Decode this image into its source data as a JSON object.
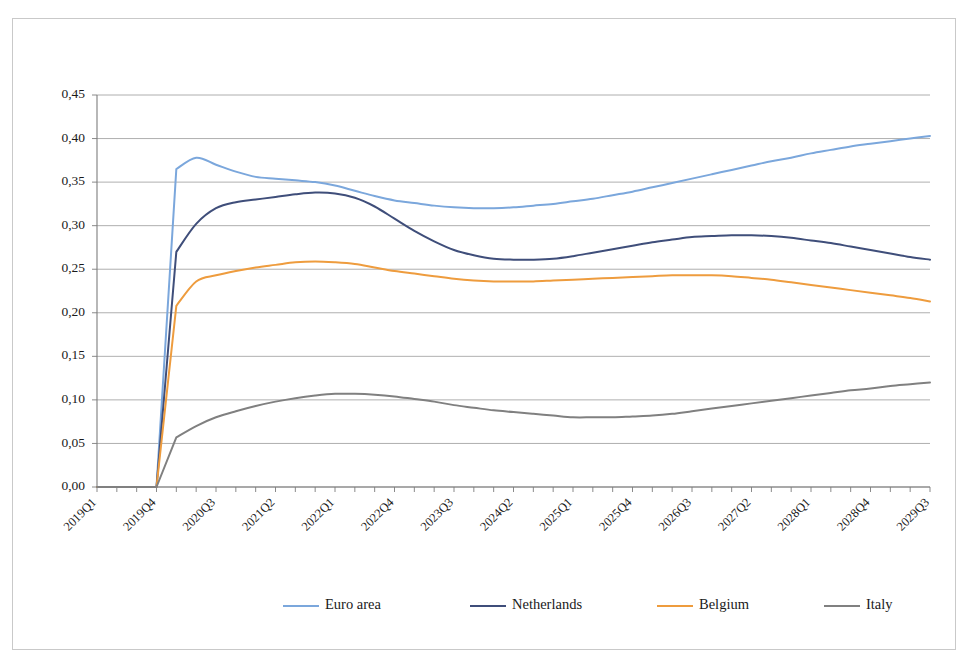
{
  "chart_data": {
    "type": "line",
    "title": "",
    "xlabel": "",
    "ylabel": "",
    "ylim": [
      0.0,
      0.45
    ],
    "ytick_step": 0.05,
    "ytick_labels": [
      "0,00",
      "0,05",
      "0,10",
      "0,15",
      "0,20",
      "0,25",
      "0,30",
      "0,35",
      "0,40",
      "0,45"
    ],
    "ytick_values": [
      0.0,
      0.05,
      0.1,
      0.15,
      0.2,
      0.25,
      0.3,
      0.35,
      0.4,
      0.45
    ],
    "grid": true,
    "legend_position": "bottom",
    "decimal_separator": ",",
    "x": [
      "2019Q1",
      "2019Q2",
      "2019Q3",
      "2019Q4",
      "2020Q1",
      "2020Q2",
      "2020Q3",
      "2020Q4",
      "2021Q1",
      "2021Q2",
      "2021Q3",
      "2021Q4",
      "2022Q1",
      "2022Q2",
      "2022Q3",
      "2022Q4",
      "2023Q1",
      "2023Q2",
      "2023Q3",
      "2023Q4",
      "2024Q1",
      "2024Q2",
      "2024Q3",
      "2024Q4",
      "2025Q1",
      "2025Q2",
      "2025Q3",
      "2025Q4",
      "2026Q1",
      "2026Q2",
      "2026Q3",
      "2026Q4",
      "2027Q1",
      "2027Q2",
      "2027Q3",
      "2027Q4",
      "2028Q1",
      "2028Q2",
      "2028Q3",
      "2028Q4",
      "2029Q1",
      "2029Q2",
      "2029Q3"
    ],
    "xtick_labels": [
      "2019Q1",
      "2019Q4",
      "2020Q3",
      "2021Q2",
      "2022Q1",
      "2022Q4",
      "2023Q3",
      "2024Q2",
      "2025Q1",
      "2025Q4",
      "2026Q3",
      "2027Q2",
      "2028Q1",
      "2028Q4",
      "2029Q3"
    ],
    "xtick_indices": [
      0,
      3,
      6,
      9,
      12,
      15,
      18,
      21,
      24,
      27,
      30,
      33,
      36,
      39,
      42
    ],
    "series": [
      {
        "name": "Euro area",
        "color": "#7BA7DC",
        "values": [
          0.0,
          0.0,
          0.0,
          0.0,
          0.365,
          0.378,
          0.37,
          0.362,
          0.356,
          0.354,
          0.352,
          0.35,
          0.346,
          0.34,
          0.334,
          0.329,
          0.326,
          0.323,
          0.321,
          0.32,
          0.32,
          0.321,
          0.323,
          0.325,
          0.328,
          0.331,
          0.335,
          0.339,
          0.344,
          0.349,
          0.354,
          0.359,
          0.364,
          0.369,
          0.374,
          0.378,
          0.383,
          0.387,
          0.391,
          0.394,
          0.397,
          0.4,
          0.403
        ]
      },
      {
        "name": "Netherlands",
        "color": "#3F4E7A",
        "values": [
          0.0,
          0.0,
          0.0,
          0.0,
          0.27,
          0.302,
          0.32,
          0.327,
          0.33,
          0.333,
          0.336,
          0.338,
          0.337,
          0.332,
          0.322,
          0.308,
          0.294,
          0.282,
          0.272,
          0.266,
          0.262,
          0.261,
          0.261,
          0.262,
          0.265,
          0.269,
          0.273,
          0.277,
          0.281,
          0.284,
          0.287,
          0.288,
          0.289,
          0.289,
          0.288,
          0.286,
          0.283,
          0.28,
          0.276,
          0.272,
          0.268,
          0.264,
          0.261
        ]
      },
      {
        "name": "Belgium",
        "color": "#EE9C3E",
        "values": [
          0.0,
          0.0,
          0.0,
          0.0,
          0.208,
          0.236,
          0.243,
          0.248,
          0.252,
          0.255,
          0.258,
          0.259,
          0.258,
          0.256,
          0.252,
          0.248,
          0.245,
          0.242,
          0.239,
          0.237,
          0.236,
          0.236,
          0.236,
          0.237,
          0.238,
          0.239,
          0.24,
          0.241,
          0.242,
          0.243,
          0.243,
          0.243,
          0.242,
          0.24,
          0.238,
          0.235,
          0.232,
          0.229,
          0.226,
          0.223,
          0.22,
          0.217,
          0.213
        ]
      },
      {
        "name": "Italy",
        "color": "#808080",
        "values": [
          0.0,
          0.0,
          0.0,
          0.0,
          0.057,
          0.07,
          0.08,
          0.087,
          0.093,
          0.098,
          0.102,
          0.105,
          0.107,
          0.107,
          0.106,
          0.104,
          0.101,
          0.098,
          0.094,
          0.091,
          0.088,
          0.086,
          0.084,
          0.082,
          0.08,
          0.08,
          0.08,
          0.081,
          0.082,
          0.084,
          0.087,
          0.09,
          0.093,
          0.096,
          0.099,
          0.102,
          0.105,
          0.108,
          0.111,
          0.113,
          0.116,
          0.118,
          0.12
        ]
      }
    ],
    "legend": [
      {
        "label": "Euro area",
        "color": "#7BA7DC"
      },
      {
        "label": "Netherlands",
        "color": "#3F4E7A"
      },
      {
        "label": "Belgium",
        "color": "#EE9C3E"
      },
      {
        "label": "Italy",
        "color": "#808080"
      }
    ]
  },
  "plot_geometry": {
    "left": 97,
    "right": 930,
    "top": 95,
    "bottom": 487,
    "legend_y": 606,
    "legend_x_positions": [
      283,
      470,
      657,
      824
    ]
  }
}
